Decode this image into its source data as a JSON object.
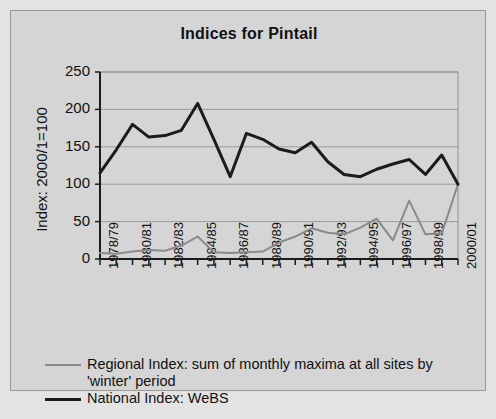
{
  "figure": {
    "title": "Indices for Pintail",
    "background_color": "#d5d5d5",
    "page_background_color": "#e3e3e3",
    "border_color": "#9a9a9a"
  },
  "legend": {
    "items": [
      {
        "label": "Regional Index: sum of monthly maxima at all sites by 'winter' period",
        "color": "#8a8a8a",
        "width": 2
      },
      {
        "label": "National Index: WeBS",
        "color": "#1b1b1b",
        "width": 3
      }
    ]
  },
  "chart_data": {
    "type": "line",
    "title": "Indices for Pintail",
    "xlabel": "",
    "ylabel": "Index: 2000/1=100",
    "ylim": [
      0,
      250
    ],
    "yticks": [
      0,
      50,
      100,
      150,
      200,
      250
    ],
    "ytick_labels": [
      "0",
      "50",
      "100",
      "150",
      "200",
      "250"
    ],
    "grid": true,
    "grid_axis": "y",
    "legend_position": "below",
    "categories": [
      "1978/79",
      "1979/80",
      "1980/81",
      "1981/82",
      "1982/83",
      "1983/84",
      "1984/85",
      "1985/86",
      "1986/87",
      "1987/88",
      "1988/89",
      "1989/90",
      "1990/91",
      "1991/92",
      "1992/93",
      "1993/94",
      "1994/95",
      "1995/96",
      "1996/97",
      "1997/98",
      "1998/99",
      "1999/00",
      "2000/01"
    ],
    "xtick_labels_shown": [
      "1978/79",
      "1980/81",
      "1982/83",
      "1984/85",
      "1986/87",
      "1988/89",
      "1990/91",
      "1992/93",
      "1994/95",
      "1996/97",
      "1998/99",
      "2000/01"
    ],
    "series": [
      {
        "name": "National Index: WeBS",
        "color": "#1b1b1b",
        "values": [
          115,
          146,
          180,
          163,
          165,
          172,
          208,
          160,
          110,
          168,
          160,
          147,
          142,
          156,
          130,
          113,
          110,
          120,
          127,
          133,
          113,
          139,
          100
        ]
      },
      {
        "name": "Regional Index: sum of monthly maxima at all sites by 'winter' period",
        "color": "#8a8a8a",
        "values": [
          8,
          7,
          10,
          12,
          11,
          18,
          30,
          9,
          8,
          9,
          10,
          22,
          30,
          41,
          35,
          33,
          42,
          54,
          25,
          78,
          33,
          34,
          100
        ]
      }
    ]
  }
}
